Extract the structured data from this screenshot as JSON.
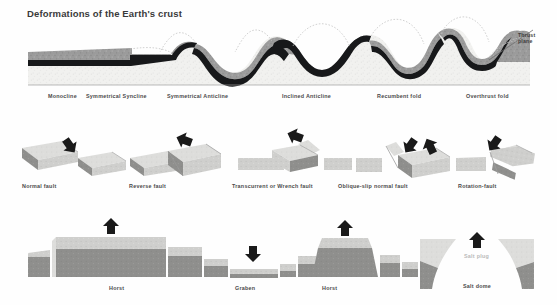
{
  "figure": {
    "title": "Deformations of the Earth's crust",
    "background_color": "#fefefe",
    "title_color": "#3a3a3a",
    "width": 557,
    "height": 305
  },
  "palette": {
    "rock_upper": "#9a9a9a",
    "rock_lower": "#f0f0ee",
    "marker_bed": "#17181a",
    "block_top": "#c9c9c7",
    "block_face": "#8f8f8d",
    "block_light": "#dcdcda",
    "arrow": "#1a1a1a",
    "dotted_line": "#bdbdbd",
    "caption": "#4a4a4a",
    "caption_faint": "#b9b9b9"
  },
  "annotations": {
    "thrust_plane_line1": "Thrust",
    "thrust_plane_line2": "plane"
  },
  "rows": [
    {
      "id": "folds",
      "name": "fold-cross-section",
      "captions": [
        {
          "label": "Monocline",
          "x": 48,
          "y": 93
        },
        {
          "label": "Symmetrical Syncline",
          "x": 86,
          "y": 93
        },
        {
          "label": "Symmetrical Anticline",
          "x": 167,
          "y": 93
        },
        {
          "label": "Inclined Anticline",
          "x": 282,
          "y": 93
        },
        {
          "label": "Recumbent fold",
          "x": 377,
          "y": 93
        },
        {
          "label": "Overthrust fold",
          "x": 466,
          "y": 93
        }
      ]
    },
    {
      "id": "faults",
      "name": "fault-block-diagrams",
      "captions": [
        {
          "label": "Normal fault",
          "x": 22,
          "y": 183
        },
        {
          "label": "Reverse fault",
          "x": 129,
          "y": 183
        },
        {
          "label": "Transcurrent or Wrench fault",
          "x": 232,
          "y": 183
        },
        {
          "label": "Oblique-slip normal fault",
          "x": 338,
          "y": 183
        },
        {
          "label": "Rotation-fault",
          "x": 458,
          "y": 183
        }
      ]
    },
    {
      "id": "horst-graben",
      "name": "horst-graben-salt-dome",
      "captions": [
        {
          "label": "Horst",
          "x": 109,
          "y": 285
        },
        {
          "label": "Graben",
          "x": 235,
          "y": 285
        },
        {
          "label": "Horst",
          "x": 322,
          "y": 285
        },
        {
          "label": "Salt dome",
          "x": 463,
          "y": 283
        }
      ],
      "faint_captions": [
        {
          "label": "Salt plug",
          "x": 464,
          "y": 253
        }
      ]
    }
  ]
}
